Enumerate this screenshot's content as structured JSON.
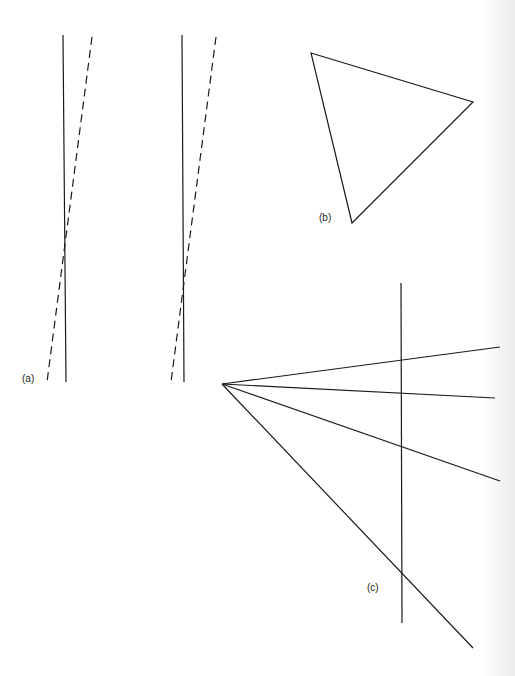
{
  "figure": {
    "panels": [
      {
        "id": "a",
        "label": "(a)",
        "label_pos": [
          22,
          373
        ],
        "pairs": [
          {
            "solid": [
              [
                63,
                35
              ],
              [
                66,
                382
              ]
            ],
            "dashed": [
              [
                92,
                37
              ],
              [
                47,
                382
              ]
            ]
          },
          {
            "solid": [
              [
                182,
                35
              ],
              [
                184,
                382
              ]
            ],
            "dashed": [
              [
                216,
                37
              ],
              [
                171,
                382
              ]
            ]
          }
        ]
      },
      {
        "id": "b",
        "label": "(b)",
        "label_pos": [
          319,
          212
        ],
        "triangle": [
          [
            311,
            53
          ],
          [
            473,
            102
          ],
          [
            352,
            223
          ]
        ]
      },
      {
        "id": "c",
        "label": "(c)",
        "label_pos": [
          367,
          582
        ],
        "apex": [
          222,
          384
        ],
        "vertical": [
          [
            401,
            283
          ],
          [
            402,
            623
          ]
        ],
        "rays": [
          [
            500,
            347
          ],
          [
            495,
            398
          ],
          [
            500,
            481
          ],
          [
            473,
            648
          ]
        ]
      }
    ],
    "stroke_color": "#1a1a1a",
    "dash_pattern": "8 5"
  }
}
